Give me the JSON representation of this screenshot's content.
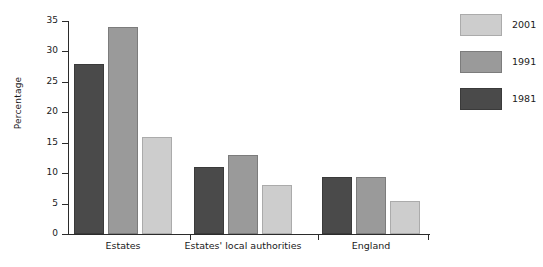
{
  "chart_data": {
    "type": "bar",
    "title": "",
    "subtitle": "",
    "xlabel": "",
    "ylabel": "Percentage",
    "ylim": [
      0,
      35
    ],
    "ytick_values": [
      0,
      5,
      10,
      15,
      20,
      25,
      30,
      35
    ],
    "ytick_labels": [
      "0",
      "5",
      "10",
      "15",
      "20",
      "25",
      "30",
      "35"
    ],
    "grid": false,
    "legend_position": "right",
    "categories": [
      "Estates",
      "Estates' local authorities",
      "England"
    ],
    "series": [
      {
        "name": "1981",
        "color": "#4a4a4a",
        "values": [
          28,
          11,
          9.3
        ]
      },
      {
        "name": "1991",
        "color": "#9a9a9a",
        "values": [
          34,
          13,
          9.3
        ]
      },
      {
        "name": "2001",
        "color": "#cdcdcd",
        "values": [
          16,
          8,
          5.4
        ]
      }
    ],
    "legend_order": [
      "2001",
      "1991",
      "1981"
    ]
  },
  "legend": {
    "entries": [
      {
        "label": "2001",
        "swatch": "light"
      },
      {
        "label": "1991",
        "swatch": "mid"
      },
      {
        "label": "1981",
        "swatch": "dark"
      }
    ]
  }
}
